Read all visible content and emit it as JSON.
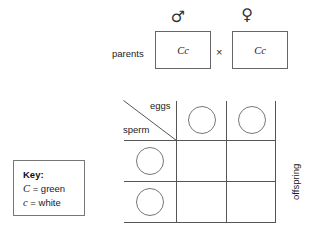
{
  "diagram": {
    "title_present": false,
    "parents": {
      "label": "parents",
      "cross_symbol": "×",
      "father": {
        "sex_icon": "male-symbol",
        "sex_glyph": "♂",
        "genotype": "Cc"
      },
      "mother": {
        "sex_icon": "female-symbol",
        "sex_glyph": "♀",
        "genotype": "Cc"
      }
    },
    "key": {
      "title": "Key:",
      "entries": [
        {
          "allele": "C",
          "equals": "=",
          "phenotype": "green"
        },
        {
          "allele": "c",
          "equals": "=",
          "phenotype": "white"
        }
      ]
    },
    "punnett": {
      "eggs_label": "eggs",
      "sperm_label": "sperm",
      "offspring_label": "offspring",
      "egg_gametes": [
        "",
        ""
      ],
      "sperm_gametes": [
        "",
        ""
      ],
      "cells": [
        [
          "",
          ""
        ],
        [
          "",
          ""
        ]
      ],
      "columns": 2,
      "rows": 2
    }
  },
  "colors": {
    "line": "#555555",
    "box_border": "#666666",
    "circle_border": "#777777",
    "text": "#222222",
    "background": "#ffffff"
  }
}
